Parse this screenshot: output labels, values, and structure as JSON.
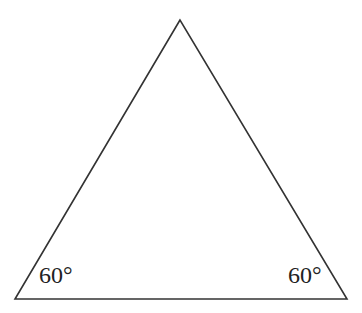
{
  "diagram": {
    "type": "equilateral-triangle",
    "stroke_color": "#333333",
    "vertices": {
      "apex": [
        180,
        20
      ],
      "bottom_left": [
        15,
        299
      ],
      "bottom_right": [
        347,
        299
      ]
    },
    "angle_labels": [
      {
        "text": "60°",
        "position": "bottom-left"
      },
      {
        "text": "60°",
        "position": "bottom-right"
      }
    ]
  }
}
